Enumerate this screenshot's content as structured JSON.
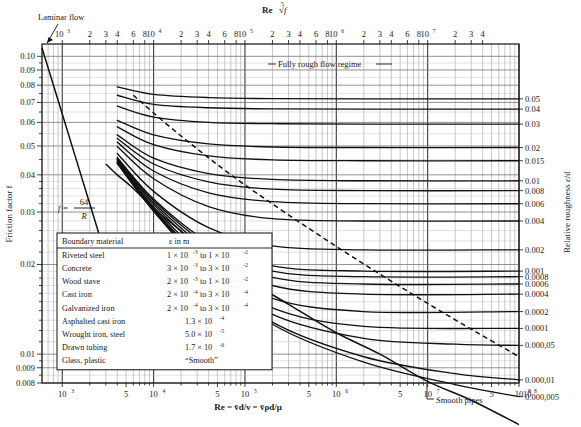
{
  "figure": {
    "kind": "moody-diagram",
    "top_axis_title": "Re",
    "top_axis_title_radical": "√f",
    "top_axis_radical_index": "5",
    "left_axis_title": "Friction factor f",
    "right_axis_title": "Relative roughness ε/d",
    "bottom_axis_title": "Re = v̄d/ν = v̄ρd/μ"
  },
  "annotations": [
    {
      "name": "laminar-flow",
      "text": "Laminar flow"
    },
    {
      "name": "fully-rough",
      "text": "Fully rough flow regime"
    },
    {
      "name": "smooth-pipes",
      "text": "Smooth pipes"
    },
    {
      "name": "laminar-equation",
      "num": "64",
      "den": "R",
      "lhs": "f ="
    }
  ],
  "bottom_ticks": [
    {
      "mant": "10",
      "exp": "3"
    },
    {
      "mant": "5",
      "exp": ""
    },
    {
      "mant": "10",
      "exp": "4"
    },
    {
      "mant": "5",
      "exp": ""
    },
    {
      "mant": "10",
      "exp": "5"
    },
    {
      "mant": "5",
      "exp": ""
    },
    {
      "mant": "10",
      "exp": "6"
    },
    {
      "mant": "5",
      "exp": ""
    },
    {
      "mant": "10",
      "exp": "7"
    },
    {
      "mant": "5",
      "exp": ""
    },
    {
      "mant": "10",
      "exp": "8"
    }
  ],
  "top_ticks": [
    {
      "mant": "10",
      "exp": "3"
    },
    {
      "mant": "2",
      "exp": ""
    },
    {
      "mant": "3",
      "exp": ""
    },
    {
      "mant": "4",
      "exp": ""
    },
    {
      "mant": "6",
      "exp": ""
    },
    {
      "mant": "8",
      "exp": ""
    },
    {
      "mant": "10",
      "exp": "4"
    },
    {
      "mant": "2",
      "exp": ""
    },
    {
      "mant": "3",
      "exp": ""
    },
    {
      "mant": "4",
      "exp": ""
    },
    {
      "mant": "6",
      "exp": ""
    },
    {
      "mant": "8",
      "exp": ""
    },
    {
      "mant": "10",
      "exp": "5"
    },
    {
      "mant": "2",
      "exp": ""
    },
    {
      "mant": "3",
      "exp": ""
    },
    {
      "mant": "4",
      "exp": ""
    },
    {
      "mant": "6",
      "exp": ""
    },
    {
      "mant": "8",
      "exp": ""
    },
    {
      "mant": "10",
      "exp": "6"
    },
    {
      "mant": "2",
      "exp": ""
    },
    {
      "mant": "3",
      "exp": ""
    },
    {
      "mant": "4",
      "exp": ""
    },
    {
      "mant": "6",
      "exp": ""
    },
    {
      "mant": "8",
      "exp": ""
    },
    {
      "mant": "10",
      "exp": "7"
    },
    {
      "mant": "2",
      "exp": ""
    },
    {
      "mant": "3",
      "exp": ""
    },
    {
      "mant": "4",
      "exp": ""
    }
  ],
  "left_ticks": [
    "0.10",
    "0.09",
    "0.08",
    "0.07",
    "0.06",
    "0.05",
    "0.04",
    "0.03",
    "0.02",
    "0.01",
    "0.009",
    "0.008"
  ],
  "right_ticks": [
    "0.05",
    "0.04",
    "0.03",
    "0.02",
    "0.015",
    "0.01",
    "0.008",
    "0.006",
    "0.004",
    "0.002",
    "0.001",
    "0.0008",
    "0.0006",
    "0.0004",
    "0.0002",
    "0.0001",
    "0.000,05",
    "0.000,01",
    "0.000,005"
  ],
  "legend": {
    "headers": [
      "Boundary material",
      "ε  in      m"
    ],
    "rows": [
      {
        "material": "Riveted steel",
        "value": "1 × 10^-3 to 1 × 10^-2"
      },
      {
        "material": "Concrete",
        "value": "3 × 10^-3 to 3 × 10^-2"
      },
      {
        "material": "Wood stave",
        "value": "2 × 10^-3 to 1 × 10^-2"
      },
      {
        "material": "Cast iron",
        "value": "2 × 10^-4 to 3 × 10^-4"
      },
      {
        "material": "Galvanized iron",
        "value": "2 × 10^-4 to 3 × 10^-4"
      },
      {
        "material": "Asphalted cast iron",
        "value": "1.3 × 10^-4"
      },
      {
        "material": "Wrought iron, steel",
        "value": "5.0 × 10^-5"
      },
      {
        "material": "Drawn tubing",
        "value": "1.7 × 10^-6"
      },
      {
        "material": "Glass, plastic",
        "value": "“Smooth”"
      }
    ]
  },
  "chart_data": {
    "type": "line",
    "xlabel": "Re = v̄d/ν = v̄ρd/μ",
    "ylabel": "Friction factor f",
    "y2label": "Relative roughness ε/d",
    "xscale": "log",
    "yscale": "log",
    "xlim": [
      600,
      100000000
    ],
    "ylim": [
      0.008,
      0.11
    ],
    "grid": true,
    "legend_position": "inset-lower-left",
    "series": [
      {
        "name": "laminar",
        "label": "f = 64/R",
        "style": "solid",
        "x": [
          600,
          1000,
          2000,
          3000
        ],
        "y": [
          0.1067,
          0.064,
          0.032,
          0.0213
        ]
      },
      {
        "name": "smooth",
        "label": "Smooth pipes",
        "style": "solid",
        "x": [
          3000,
          4000,
          6000,
          10000,
          20000,
          40000,
          100000,
          300000,
          1000000,
          3000000,
          10000000,
          30000000,
          100000000
        ],
        "y": [
          0.0435,
          0.04,
          0.036,
          0.0309,
          0.0259,
          0.0219,
          0.018,
          0.0147,
          0.0118,
          0.01,
          0.0081,
          0.007,
          0.0058
        ]
      },
      {
        "name": "transition-dashed",
        "label": "fully rough boundary",
        "style": "dashed",
        "x": [
          6000,
          20000,
          100000,
          1000000,
          10000000,
          100000000
        ],
        "y": [
          0.074,
          0.054,
          0.037,
          0.023,
          0.0148,
          0.0098
        ]
      },
      {
        "name": "eps/d=0.05",
        "eps_d": 0.05,
        "style": "solid",
        "x": [
          4000,
          10000,
          40000,
          200000,
          2000000,
          100000000
        ],
        "y": [
          0.079,
          0.0745,
          0.0727,
          0.0721,
          0.072,
          0.072
        ]
      },
      {
        "name": "eps/d=0.04",
        "eps_d": 0.04,
        "style": "solid",
        "x": [
          4000,
          10000,
          40000,
          200000,
          2000000,
          100000000
        ],
        "y": [
          0.074,
          0.069,
          0.0672,
          0.0666,
          0.0665,
          0.0665
        ]
      },
      {
        "name": "eps/d=0.03",
        "eps_d": 0.03,
        "style": "solid",
        "x": [
          4000,
          10000,
          40000,
          200000,
          2000000,
          100000000
        ],
        "y": [
          0.068,
          0.0625,
          0.06,
          0.0594,
          0.0592,
          0.0592
        ]
      },
      {
        "name": "eps/d=0.02",
        "eps_d": 0.02,
        "style": "solid",
        "x": [
          4000,
          10000,
          40000,
          200000,
          2000000,
          100000000
        ],
        "y": [
          0.061,
          0.0545,
          0.0508,
          0.0496,
          0.0494,
          0.0494
        ]
      },
      {
        "name": "eps/d=0.015",
        "eps_d": 0.015,
        "style": "solid",
        "x": [
          4000,
          10000,
          40000,
          200000,
          2000000,
          100000000
        ],
        "y": [
          0.058,
          0.0505,
          0.0463,
          0.0449,
          0.0446,
          0.0446
        ]
      },
      {
        "name": "eps/d=0.01",
        "eps_d": 0.01,
        "style": "solid",
        "x": [
          4000,
          10000,
          40000,
          200000,
          2000000,
          100000000
        ],
        "y": [
          0.0545,
          0.0455,
          0.0404,
          0.0386,
          0.0382,
          0.0382
        ]
      },
      {
        "name": "eps/d=0.008",
        "eps_d": 0.008,
        "style": "solid",
        "x": [
          4000,
          10000,
          40000,
          200000,
          2000000,
          100000000
        ],
        "y": [
          0.053,
          0.0435,
          0.0379,
          0.0358,
          0.0354,
          0.0354
        ]
      },
      {
        "name": "eps/d=0.006",
        "eps_d": 0.006,
        "style": "solid",
        "x": [
          4000,
          10000,
          40000,
          200000,
          2000000,
          100000000
        ],
        "y": [
          0.0515,
          0.0412,
          0.0348,
          0.0325,
          0.032,
          0.032
        ]
      },
      {
        "name": "eps/d=0.004",
        "eps_d": 0.004,
        "style": "solid",
        "x": [
          4000,
          10000,
          40000,
          200000,
          2000000,
          100000000
        ],
        "y": [
          0.0498,
          0.0388,
          0.0313,
          0.0285,
          0.028,
          0.028
        ]
      },
      {
        "name": "eps/d=0.002",
        "eps_d": 0.002,
        "style": "solid",
        "x": [
          4000,
          10000,
          40000,
          200000,
          2000000,
          100000000
        ],
        "y": [
          0.0472,
          0.0352,
          0.0266,
          0.0231,
          0.0224,
          0.0224
        ]
      },
      {
        "name": "eps/d=0.001",
        "eps_d": 0.001,
        "style": "solid",
        "x": [
          4000,
          10000,
          40000,
          200000,
          2000000,
          100000000
        ],
        "y": [
          0.0458,
          0.0332,
          0.0238,
          0.0198,
          0.019,
          0.019
        ]
      },
      {
        "name": "eps/d=0.0008",
        "eps_d": 0.0008,
        "style": "solid",
        "x": [
          4000,
          10000,
          40000,
          200000,
          2000000,
          100000000
        ],
        "y": [
          0.0455,
          0.0328,
          0.0232,
          0.019,
          0.0182,
          0.0182
        ]
      },
      {
        "name": "eps/d=0.0006",
        "eps_d": 0.0006,
        "style": "solid",
        "x": [
          4000,
          10000,
          40000,
          200000,
          2000000,
          100000000
        ],
        "y": [
          0.0452,
          0.0323,
          0.0225,
          0.0181,
          0.0172,
          0.0172
        ]
      },
      {
        "name": "eps/d=0.0004",
        "eps_d": 0.0004,
        "style": "solid",
        "x": [
          4000,
          10000,
          40000,
          200000,
          2000000,
          100000000
        ],
        "y": [
          0.0449,
          0.0318,
          0.0217,
          0.017,
          0.0159,
          0.0159
        ]
      },
      {
        "name": "eps/d=0.0002",
        "eps_d": 0.0002,
        "style": "solid",
        "x": [
          4000,
          10000,
          40000,
          200000,
          2000000,
          100000000
        ],
        "y": [
          0.0445,
          0.0312,
          0.0206,
          0.0154,
          0.0139,
          0.0139
        ]
      },
      {
        "name": "eps/d=0.0001",
        "eps_d": 0.0001,
        "style": "solid",
        "x": [
          4000,
          10000,
          40000,
          200000,
          2000000,
          100000000
        ],
        "y": [
          0.0442,
          0.0308,
          0.0199,
          0.0143,
          0.0124,
          0.0122
        ]
      },
      {
        "name": "eps/d=0.00005",
        "eps_d": 5e-05,
        "style": "solid",
        "x": [
          4000,
          10000,
          40000,
          200000,
          2000000,
          20000000,
          100000000
        ],
        "y": [
          0.044,
          0.0306,
          0.0195,
          0.0136,
          0.0113,
          0.0108,
          0.0107
        ]
      },
      {
        "name": "eps/d=0.00001",
        "eps_d": 1e-05,
        "style": "solid",
        "x": [
          4000,
          10000,
          40000,
          200000,
          2000000,
          20000000,
          100000000
        ],
        "y": [
          0.0438,
          0.0303,
          0.0191,
          0.0128,
          0.0098,
          0.0086,
          0.0082
        ]
      },
      {
        "name": "eps/d=0.000005",
        "eps_d": 5e-06,
        "style": "solid",
        "x": [
          4000,
          10000,
          40000,
          200000,
          2000000,
          20000000,
          100000000
        ],
        "y": [
          0.0437,
          0.0302,
          0.019,
          0.0126,
          0.0094,
          0.0079,
          0.0072
        ]
      }
    ]
  }
}
